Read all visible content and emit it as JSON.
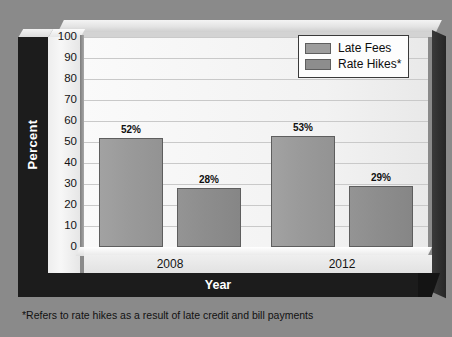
{
  "chart_data": {
    "type": "bar",
    "title": "",
    "xlabel": "Year",
    "ylabel": "Percent",
    "categories": [
      "2008",
      "2012"
    ],
    "series": [
      {
        "name": "Late Fees",
        "values": [
          52,
          53
        ],
        "color": "#9d9d9d"
      },
      {
        "name": "Rate Hikes*",
        "values": [
          28,
          29
        ],
        "color": "#8d8d8d"
      }
    ],
    "bar_labels": [
      "52%",
      "53%",
      "28%",
      "29%"
    ],
    "ylim": [
      0,
      100
    ],
    "yticks": [
      0,
      10,
      20,
      30,
      40,
      50,
      60,
      70,
      80,
      90,
      100
    ],
    "ytick_labels": [
      "0",
      "10",
      "20",
      "30",
      "40",
      "50",
      "60",
      "70",
      "80",
      "90",
      "100"
    ],
    "grid": true,
    "legend_position": "top-right",
    "value_unit": "%"
  },
  "axes": {
    "y_title": "Percent",
    "x_title": "Year",
    "x_tick_labels": [
      "2008",
      "2012"
    ],
    "y_tick_labels": [
      "100",
      "90",
      "80",
      "70",
      "60",
      "50",
      "40",
      "30",
      "20",
      "10",
      "0"
    ]
  },
  "legend": {
    "items": [
      {
        "label": "Late Fees",
        "color": "#9d9d9d"
      },
      {
        "label": "Rate Hikes*",
        "color": "#8d8d8d"
      }
    ]
  },
  "bars": [
    {
      "label": "52%",
      "value": 52,
      "series": "Late Fees",
      "category": "2008"
    },
    {
      "label": "53%",
      "value": 53,
      "series": "Rate Hikes*",
      "category": "2008"
    },
    {
      "label": "28%",
      "value": 28,
      "series": "Late Fees",
      "category": "2012"
    },
    {
      "label": "29%",
      "value": 29,
      "series": "Rate Hikes*",
      "category": "2012"
    }
  ],
  "footnote": "*Refers to rate hikes as a result of late credit and bill payments",
  "colors": {
    "background": "#8a8a8a",
    "plot_area": "#f5f5f5",
    "band": "#1c1c1c",
    "gridline": "#c9c9c9",
    "series_late_fees": "#9d9d9d",
    "series_rate_hikes": "#8d8d8d"
  }
}
